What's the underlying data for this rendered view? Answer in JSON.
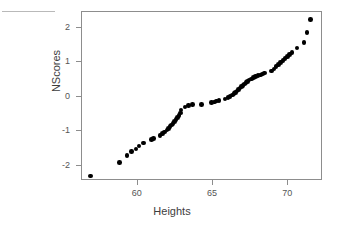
{
  "chart_data": {
    "type": "scatter",
    "title": "",
    "subtitle": "",
    "xlabel": "Heights",
    "ylabel": "NScores",
    "xlim": [
      56.3,
      72.3
    ],
    "ylim": [
      -2.45,
      2.46
    ],
    "xticks": [
      60,
      65,
      70
    ],
    "xticklabels": [
      "60",
      "65",
      "70"
    ],
    "yticks": [
      -2,
      -1,
      0,
      1,
      2
    ],
    "yticklabels": [
      "-2",
      "-1",
      "0",
      "1",
      "2"
    ],
    "grid": false,
    "legend": null,
    "legend_position": "none",
    "marker": "filled-circle",
    "marker_color": "#000000",
    "frame_color": "#8d8d8d",
    "background_color": "#ffffff",
    "annotations": [],
    "series": [
      {
        "name": "Normal quantile plot of Heights",
        "x": [
          56.95,
          58.85,
          59.35,
          59.65,
          59.95,
          60.15,
          60.45,
          61.0,
          61.1,
          61.55,
          61.7,
          61.85,
          62.0,
          62.1,
          62.2,
          62.3,
          62.4,
          62.5,
          62.6,
          62.7,
          62.8,
          62.9,
          62.95,
          63.2,
          63.45,
          63.7,
          64.3,
          64.95,
          65.15,
          65.3,
          65.45,
          65.85,
          66.05,
          66.2,
          66.35,
          66.45,
          66.55,
          66.65,
          66.75,
          66.85,
          66.95,
          67.05,
          67.15,
          67.25,
          67.35,
          67.45,
          67.6,
          67.75,
          67.9,
          68.05,
          68.2,
          68.35,
          68.5,
          68.95,
          69.1,
          69.25,
          69.4,
          69.55,
          69.7,
          69.85,
          70.0,
          70.15,
          70.3,
          70.65,
          71.1,
          71.3,
          71.55
        ],
        "y": [
          -2.33,
          -1.94,
          -1.73,
          -1.63,
          -1.55,
          -1.46,
          -1.38,
          -1.28,
          -1.24,
          -1.15,
          -1.1,
          -1.05,
          -1.0,
          -0.95,
          -0.9,
          -0.85,
          -0.8,
          -0.75,
          -0.7,
          -0.64,
          -0.58,
          -0.5,
          -0.42,
          -0.33,
          -0.28,
          -0.26,
          -0.25,
          -0.2,
          -0.18,
          -0.16,
          -0.14,
          -0.1,
          -0.06,
          -0.02,
          0.02,
          0.06,
          0.1,
          0.14,
          0.18,
          0.22,
          0.26,
          0.3,
          0.34,
          0.38,
          0.42,
          0.46,
          0.49,
          0.52,
          0.55,
          0.58,
          0.6,
          0.63,
          0.66,
          0.72,
          0.78,
          0.84,
          0.9,
          0.96,
          1.02,
          1.08,
          1.14,
          1.2,
          1.26,
          1.38,
          1.55,
          1.84,
          2.22
        ]
      }
    ]
  },
  "figure": {
    "alt_description": "Normal quantile-quantile scatter plot of NScores versus Heights"
  }
}
